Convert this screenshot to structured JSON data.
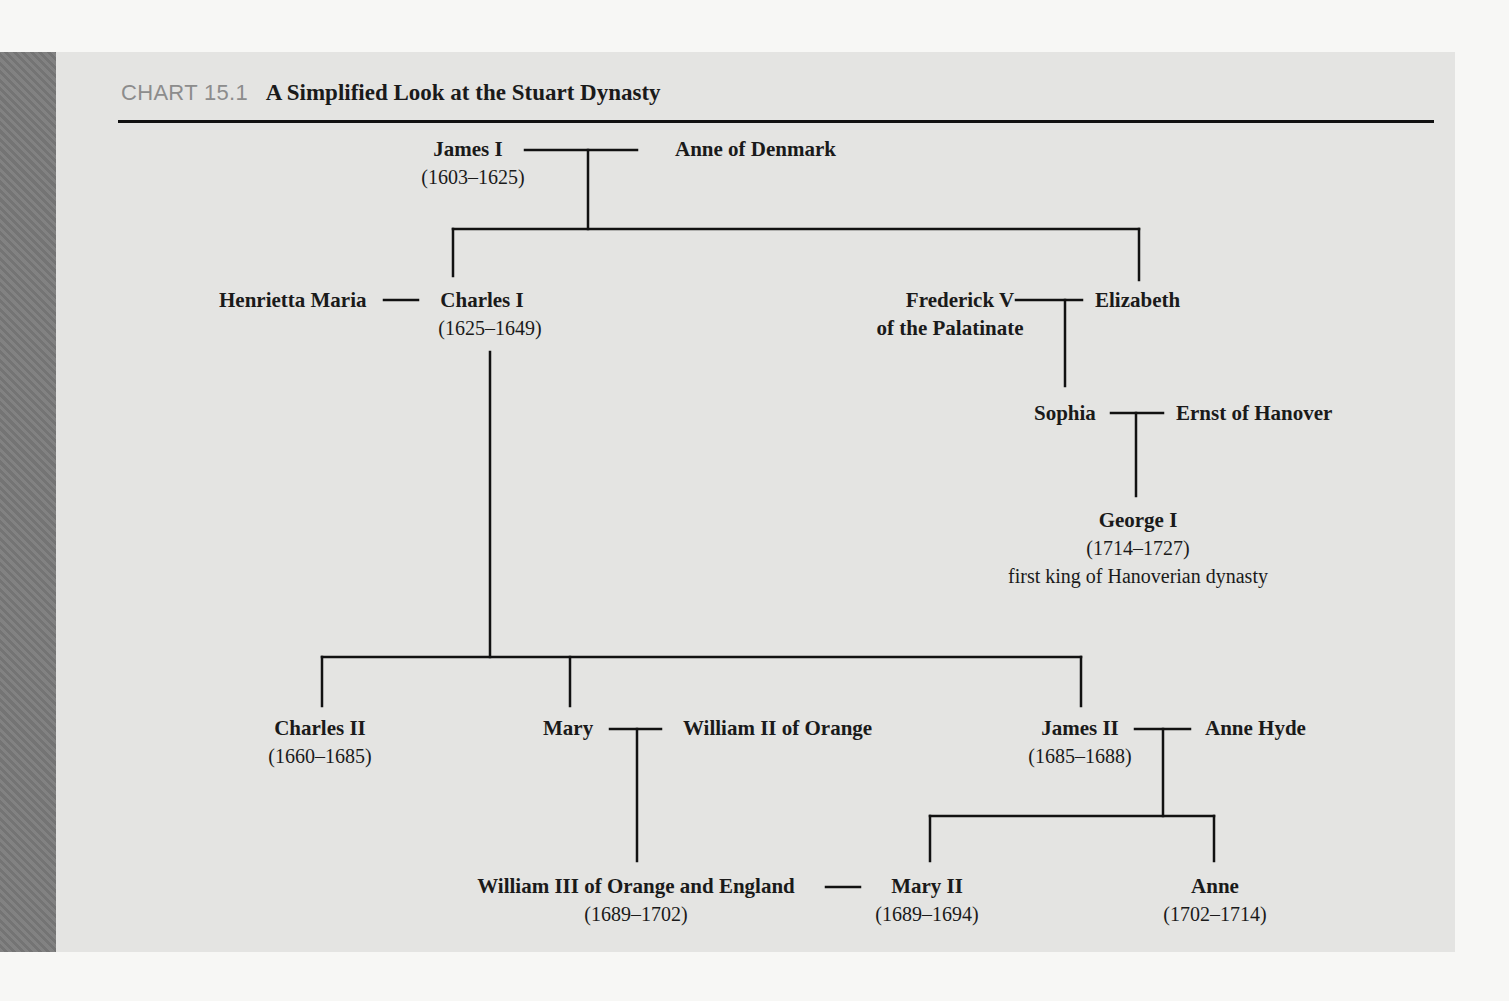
{
  "chart": {
    "label": "CHART 15.1",
    "title": "A Simplified Look at the Stuart Dynasty"
  },
  "people": {
    "james_i": {
      "name": "James I",
      "years": "(1603–1625)"
    },
    "anne_of_denmark": {
      "name": "Anne of Denmark"
    },
    "henrietta_maria": {
      "name": "Henrietta Maria"
    },
    "charles_i": {
      "name": "Charles I",
      "years": "(1625–1649)"
    },
    "frederick_v": {
      "name": "Frederick V",
      "name2": "of the Palatinate"
    },
    "elizabeth": {
      "name": "Elizabeth"
    },
    "sophia": {
      "name": "Sophia"
    },
    "ernst_of_hanover": {
      "name": "Ernst of Hanover"
    },
    "george_i": {
      "name": "George I",
      "years": "(1714–1727)",
      "note": "first king of Hanoverian dynasty"
    },
    "charles_ii": {
      "name": "Charles II",
      "years": "(1660–1685)"
    },
    "mary": {
      "name": "Mary"
    },
    "william_ii_of_orange": {
      "name": "William II of Orange"
    },
    "james_ii": {
      "name": "James II",
      "years": "(1685–1688)"
    },
    "anne_hyde": {
      "name": "Anne Hyde"
    },
    "william_iii": {
      "name": "William III of Orange and England",
      "years": "(1689–1702)"
    },
    "mary_ii": {
      "name": "Mary II",
      "years": "(1689–1694)"
    },
    "anne": {
      "name": "Anne",
      "years": "(1702–1714)"
    }
  },
  "relationships": {
    "marriages": [
      [
        "James I",
        "Anne of Denmark"
      ],
      [
        "Henrietta Maria",
        "Charles I"
      ],
      [
        "Frederick V of the Palatinate",
        "Elizabeth"
      ],
      [
        "Sophia",
        "Ernst of Hanover"
      ],
      [
        "Mary",
        "William II of Orange"
      ],
      [
        "James II",
        "Anne Hyde"
      ],
      [
        "William III of Orange and England",
        "Mary II"
      ]
    ],
    "children": {
      "James I + Anne of Denmark": [
        "Charles I",
        "Elizabeth"
      ],
      "Charles I + Henrietta Maria": [
        "Charles II",
        "Mary",
        "James II"
      ],
      "Frederick V + Elizabeth": [
        "Sophia"
      ],
      "Sophia + Ernst of Hanover": [
        "George I"
      ],
      "Mary + William II of Orange": [
        "William III of Orange and England"
      ],
      "James II + Anne Hyde": [
        "Mary II",
        "Anne"
      ]
    }
  }
}
